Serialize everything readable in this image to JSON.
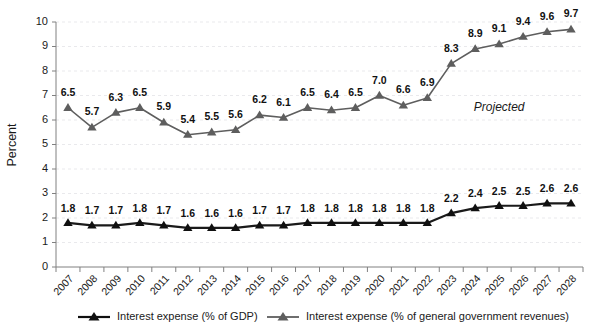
{
  "chart_data": {
    "type": "line",
    "title": "",
    "xlabel": "",
    "ylabel": "Percent",
    "ylim": [
      0,
      10
    ],
    "ytick_labels": [
      "0",
      "1",
      "2",
      "3",
      "4",
      "5",
      "6",
      "7",
      "8",
      "9",
      "10"
    ],
    "grid": true,
    "legend_position": "bottom",
    "categories": [
      "2007",
      "2008",
      "2009",
      "2010",
      "2011",
      "2012",
      "2013",
      "2014",
      "2015",
      "2016",
      "2017",
      "2018",
      "2019",
      "2020",
      "2021",
      "2022",
      "2023",
      "2024",
      "2025",
      "2026",
      "2027",
      "2028"
    ],
    "series": [
      {
        "name": "Interest expense (% of GDP)",
        "color": "#101010",
        "marker": "triangle-up",
        "values": [
          1.8,
          1.7,
          1.7,
          1.8,
          1.7,
          1.6,
          1.6,
          1.6,
          1.7,
          1.7,
          1.8,
          1.8,
          1.8,
          1.8,
          1.8,
          1.8,
          2.2,
          2.4,
          2.5,
          2.5,
          2.6,
          2.6
        ],
        "labels": [
          "1.8",
          "1.7",
          "1.7",
          "1.8",
          "1.7",
          "1.6",
          "1.6",
          "1.6",
          "1.7",
          "1.7",
          "1.8",
          "1.8",
          "1.8",
          "1.8",
          "1.8",
          "1.8",
          "2.2",
          "2.4",
          "2.5",
          "2.5",
          "2.6",
          "2.6"
        ]
      },
      {
        "name": "Interest expense (% of general government revenues)",
        "color": "#5e5e5e",
        "marker": "triangle-up",
        "values": [
          6.5,
          5.7,
          6.3,
          6.5,
          5.9,
          5.4,
          5.5,
          5.6,
          6.2,
          6.1,
          6.5,
          6.4,
          6.5,
          7.0,
          6.6,
          6.9,
          8.3,
          8.9,
          9.1,
          9.4,
          9.6,
          9.7
        ],
        "labels": [
          "6.5",
          "5.7",
          "6.3",
          "6.5",
          "5.9",
          "5.4",
          "5.5",
          "5.6",
          "6.2",
          "6.1",
          "6.5",
          "6.4",
          "6.5",
          "7.0",
          "6.6",
          "6.9",
          "8.3",
          "8.9",
          "9.1",
          "9.4",
          "9.6",
          "9.7"
        ]
      }
    ],
    "annotations": [
      {
        "text": "Projected",
        "x_category": "2025",
        "y_value": 6.35,
        "style": "italic"
      }
    ]
  },
  "legend": {
    "items": [
      {
        "label": "Interest expense (% of GDP)",
        "color": "#101010"
      },
      {
        "label": "Interest expense (% of general government revenues)",
        "color": "#5e5e5e"
      }
    ]
  }
}
